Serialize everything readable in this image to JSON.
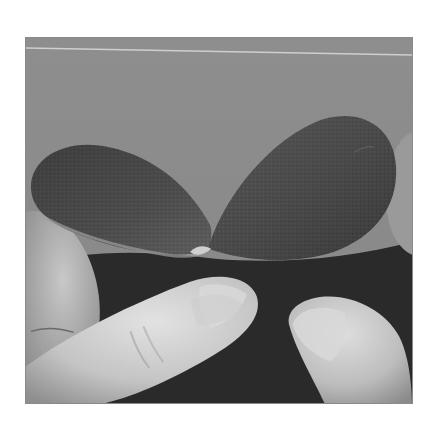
{
  "image": {
    "kind": "photograph",
    "tone": "grayscale",
    "subject": "two fingers pinching two dark textured paper petals together at their tips",
    "elements": [
      {
        "name": "backdrop",
        "description": "flat gray background with thin light horizontal line near top"
      },
      {
        "name": "left-petal",
        "description": "dark textured teardrop petal curving left"
      },
      {
        "name": "right-petal",
        "description": "dark textured teardrop petal rising to upper right"
      },
      {
        "name": "left-thumb",
        "description": "thumb pressing from lower left"
      },
      {
        "name": "right-finger",
        "description": "fingertip pressing from lower right"
      },
      {
        "name": "background-fingers",
        "description": "curled fingers at left and right edges"
      }
    ],
    "colors": {
      "backdrop": "#8c8c8c",
      "petal": "#4a4a4a",
      "petal_dark": "#2e2e2e",
      "shadow": "#1e1e1e",
      "skin_light": "#d6d6d6",
      "skin_mid": "#b0b0b0",
      "frame": "#8a8a8a"
    }
  }
}
